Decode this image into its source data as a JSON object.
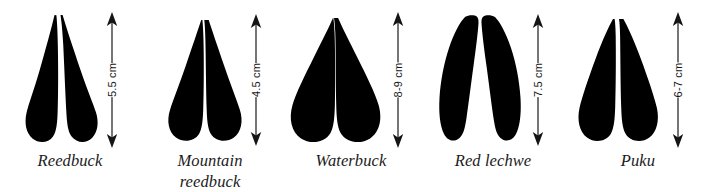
{
  "figure": {
    "background_color": "#ffffff",
    "ink_color": "#000000",
    "unit": "cm"
  },
  "specimens": [
    {
      "id": "reedbuck",
      "name_line1": "Reedbuck",
      "name_line2": "",
      "measurement": "5.5 cm",
      "size_min_cm": 5.5,
      "size_max_cm": 5.5,
      "track_shape": "narrow-pointed-tips-broad-rounded-heels",
      "arrow_name": "scale-arrow-reedbuck"
    },
    {
      "id": "mountain-reedbuck",
      "name_line1": "Mountain",
      "name_line2": "reedbuck",
      "measurement": "4.5 cm",
      "size_min_cm": 4.5,
      "size_max_cm": 4.5,
      "track_shape": "teardrop-wide-rounded-heels",
      "arrow_name": "scale-arrow-mountain-reedbuck"
    },
    {
      "id": "waterbuck",
      "name_line1": "Waterbuck",
      "name_line2": "",
      "measurement": "8-9 cm",
      "size_min_cm": 8,
      "size_max_cm": 9,
      "track_shape": "broad-splayed-rounded",
      "arrow_name": "scale-arrow-waterbuck"
    },
    {
      "id": "red-lechwe",
      "name_line1": "Red lechwe",
      "name_line2": "",
      "measurement": "7.5 cm",
      "size_min_cm": 7.5,
      "size_max_cm": 7.5,
      "track_shape": "long-narrow-curved-crescent-wide-gap",
      "arrow_name": "scale-arrow-red-lechwe"
    },
    {
      "id": "puku",
      "name_line1": "Puku",
      "name_line2": "",
      "measurement": "6-7 cm",
      "size_min_cm": 6,
      "size_max_cm": 7,
      "track_shape": "slender-tapered-rounded-heels",
      "arrow_name": "scale-arrow-puku"
    }
  ]
}
